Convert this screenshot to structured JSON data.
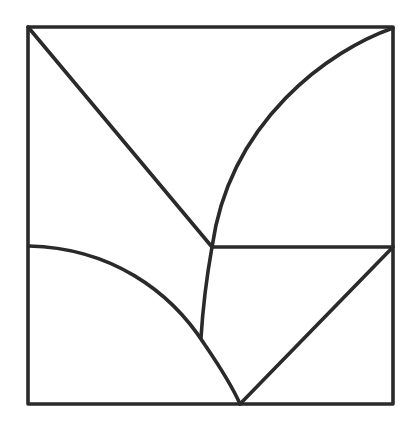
{
  "diagram": {
    "title": "",
    "stroke_color": "#2a2a2a",
    "background_color": "#ffffff",
    "square": {
      "x1": 28,
      "y1": 27,
      "x2": 393,
      "y2": 404
    },
    "points": {
      "top_left": [
        28,
        27
      ],
      "top_right": [
        393,
        27
      ],
      "bottom_left": [
        28,
        404
      ],
      "bottom_right": [
        393,
        404
      ],
      "left_mid": [
        29,
        246
      ],
      "right_mid": [
        393,
        247
      ],
      "junction": [
        212,
        247
      ],
      "inner_meet": [
        201,
        338
      ],
      "bottom_point": [
        240,
        404
      ]
    },
    "segments": [
      {
        "name": "diagonal-top-left-to-junction",
        "type": "line"
      },
      {
        "name": "arc-top-right-to-junction",
        "type": "curve"
      },
      {
        "name": "horizontal-junction-to-right",
        "type": "line"
      },
      {
        "name": "curve-junction-to-inner-meet",
        "type": "curve"
      },
      {
        "name": "arc-left-to-bottom-point",
        "type": "curve"
      },
      {
        "name": "diagonal-bottom-point-to-right-mid",
        "type": "line"
      }
    ]
  }
}
